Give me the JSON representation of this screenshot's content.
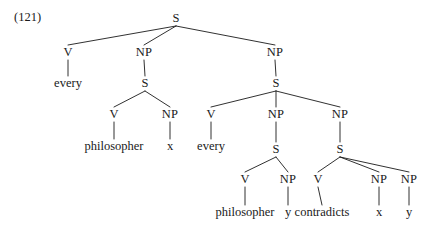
{
  "figure": {
    "example_number": "(121)",
    "ink_color": "#1a1a1a",
    "background_color": "#ffffff",
    "type": "syntax-tree"
  },
  "tree": {
    "nodes": [
      {
        "id": "n0",
        "label": "S",
        "kind": "category",
        "x": 176,
        "y": 18
      },
      {
        "id": "n1",
        "label": "V",
        "kind": "category",
        "x": 68,
        "y": 52
      },
      {
        "id": "n2",
        "label": "NP",
        "kind": "category",
        "x": 144,
        "y": 52
      },
      {
        "id": "n3",
        "label": "NP",
        "kind": "category",
        "x": 275,
        "y": 52
      },
      {
        "id": "n4",
        "label": "every",
        "kind": "leaf",
        "x": 68,
        "y": 83
      },
      {
        "id": "n5",
        "label": "S",
        "kind": "category",
        "x": 145,
        "y": 83
      },
      {
        "id": "n6",
        "label": "S",
        "kind": "category",
        "x": 276,
        "y": 83
      },
      {
        "id": "n7",
        "label": "V",
        "kind": "category",
        "x": 114,
        "y": 114
      },
      {
        "id": "n8",
        "label": "NP",
        "kind": "category",
        "x": 170,
        "y": 114
      },
      {
        "id": "n9",
        "label": "V",
        "kind": "category",
        "x": 211,
        "y": 114
      },
      {
        "id": "n10",
        "label": "NP",
        "kind": "category",
        "x": 276,
        "y": 114
      },
      {
        "id": "n11",
        "label": "NP",
        "kind": "category",
        "x": 340,
        "y": 114
      },
      {
        "id": "n12",
        "label": "philosopher",
        "kind": "leaf",
        "x": 114,
        "y": 146
      },
      {
        "id": "n13",
        "label": "x",
        "kind": "leaf",
        "x": 170,
        "y": 146
      },
      {
        "id": "n14",
        "label": "every",
        "kind": "leaf",
        "x": 211,
        "y": 146
      },
      {
        "id": "n15",
        "label": "S",
        "kind": "category",
        "x": 276,
        "y": 149
      },
      {
        "id": "n16",
        "label": "S",
        "kind": "category",
        "x": 340,
        "y": 149
      },
      {
        "id": "n17",
        "label": "V",
        "kind": "category",
        "x": 245,
        "y": 179
      },
      {
        "id": "n18",
        "label": "NP",
        "kind": "category",
        "x": 288,
        "y": 179
      },
      {
        "id": "n19",
        "label": "V",
        "kind": "category",
        "x": 318,
        "y": 179
      },
      {
        "id": "n20",
        "label": "NP",
        "kind": "category",
        "x": 379,
        "y": 179
      },
      {
        "id": "n21",
        "label": "NP",
        "kind": "category",
        "x": 409,
        "y": 179
      },
      {
        "id": "n22",
        "label": "philosopher",
        "kind": "leaf",
        "x": 245,
        "y": 212
      },
      {
        "id": "n23",
        "label": "y",
        "kind": "leaf",
        "x": 288,
        "y": 212
      },
      {
        "id": "n24",
        "label": "contradicts",
        "kind": "leaf",
        "x": 322,
        "y": 212
      },
      {
        "id": "n25",
        "label": "x",
        "kind": "leaf",
        "x": 379,
        "y": 212
      },
      {
        "id": "n26",
        "label": "y",
        "kind": "leaf",
        "x": 409,
        "y": 212
      }
    ],
    "edges": [
      {
        "from": "n0",
        "to": "n1"
      },
      {
        "from": "n0",
        "to": "n2"
      },
      {
        "from": "n0",
        "to": "n3"
      },
      {
        "from": "n1",
        "to": "n4"
      },
      {
        "from": "n2",
        "to": "n5"
      },
      {
        "from": "n3",
        "to": "n6"
      },
      {
        "from": "n5",
        "to": "n7"
      },
      {
        "from": "n5",
        "to": "n8"
      },
      {
        "from": "n6",
        "to": "n9"
      },
      {
        "from": "n6",
        "to": "n10"
      },
      {
        "from": "n6",
        "to": "n11"
      },
      {
        "from": "n7",
        "to": "n12"
      },
      {
        "from": "n8",
        "to": "n13"
      },
      {
        "from": "n9",
        "to": "n14"
      },
      {
        "from": "n10",
        "to": "n15"
      },
      {
        "from": "n11",
        "to": "n16"
      },
      {
        "from": "n15",
        "to": "n17"
      },
      {
        "from": "n15",
        "to": "n18"
      },
      {
        "from": "n16",
        "to": "n19"
      },
      {
        "from": "n16",
        "to": "n20"
      },
      {
        "from": "n16",
        "to": "n21"
      },
      {
        "from": "n17",
        "to": "n22"
      },
      {
        "from": "n18",
        "to": "n23"
      },
      {
        "from": "n19",
        "to": "n24"
      },
      {
        "from": "n20",
        "to": "n25"
      },
      {
        "from": "n21",
        "to": "n26"
      }
    ]
  }
}
